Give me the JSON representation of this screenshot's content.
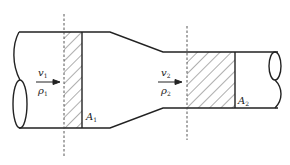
{
  "diagram": {
    "title": "",
    "section1": {
      "velocity_symbol": "v",
      "velocity_subscript": "1",
      "density_symbol": "ρ",
      "density_subscript": "1",
      "area_symbol": "A",
      "area_subscript": "1"
    },
    "section2": {
      "velocity_symbol": "v",
      "velocity_subscript": "2",
      "density_symbol": "ρ",
      "density_subscript": "2",
      "area_symbol": "A",
      "area_subscript": "2"
    },
    "colors": {
      "line": "#222222",
      "dashed": "#444444",
      "background": "#ffffff"
    }
  }
}
